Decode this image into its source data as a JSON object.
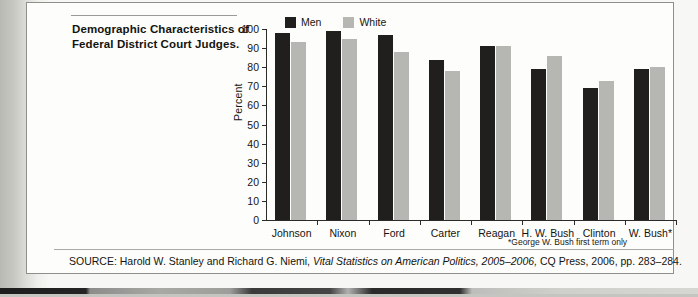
{
  "figure": {
    "title": "Demographic Characteristics of Federal District Court Judges.",
    "footnote": "*George W. Bush first term only",
    "source_prefix": "SOURCE:",
    "source_authors": "Harold W. Stanley and Richard G. Niemi,",
    "source_title_italic": "Vital Statistics on American Politics, 2005–2006,",
    "source_tail": "CQ Press, 2006, pp. 283–284."
  },
  "colors": {
    "men": "#201f1e",
    "white": "#b6b6b3",
    "axis": "#2b2b28",
    "card_background": "#fdfdfc",
    "page_background": "#cfcfcb"
  },
  "chart_data": {
    "type": "bar",
    "title": "Demographic Characteristics of Federal District Court Judges.",
    "xlabel": "",
    "ylabel": "Percent",
    "ylim": [
      0,
      100
    ],
    "ytick_step": 10,
    "yticks": [
      0,
      10,
      20,
      30,
      40,
      50,
      60,
      70,
      80,
      90,
      100
    ],
    "ytick_labels": [
      "0",
      "10",
      "20",
      "30",
      "40",
      "50",
      "60",
      "70",
      "80",
      "90",
      "100"
    ],
    "grid": false,
    "legend_position": "top-center",
    "categories": [
      "Johnson",
      "Nixon",
      "Ford",
      "Carter",
      "Reagan",
      "H. W. Bush",
      "Clinton",
      "W. Bush*"
    ],
    "series": [
      {
        "name": "Men",
        "color": "#201f1e",
        "values": [
          98,
          99,
          97,
          84,
          91,
          79,
          69,
          79
        ]
      },
      {
        "name": "White",
        "color": "#b6b6b3",
        "values": [
          93,
          95,
          88,
          78,
          91,
          86,
          73,
          80
        ]
      }
    ],
    "annotations": [
      "*George W. Bush first term only"
    ]
  }
}
